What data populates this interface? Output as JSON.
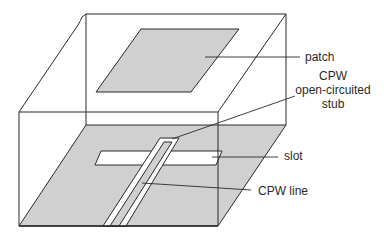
{
  "diagram": {
    "type": "3D antenna schematic",
    "colors": {
      "metal_fill": "#d0d0d0",
      "line": "#2a2a2a",
      "background": "#ffffff"
    },
    "labels": {
      "patch": "patch",
      "stub_line1": "CPW",
      "stub_line2": "open-circuited",
      "stub_line3": "stub",
      "slot": "slot",
      "cpw_line": "CPW line"
    }
  }
}
